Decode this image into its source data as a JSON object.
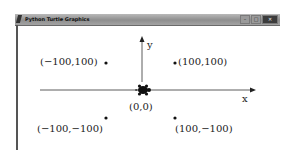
{
  "window": {
    "title": "Python Turtle Graphics",
    "buttons": {
      "minimize": "–",
      "maximize": "□",
      "close": "✕"
    }
  },
  "canvas": {
    "axes": {
      "x_label": "x",
      "y_label": "y"
    },
    "origin_label": "(0,0)",
    "points": [
      {
        "label": "(−100,100)",
        "x": -100,
        "y": 100
      },
      {
        "label": "(100,100)",
        "x": 100,
        "y": 100
      },
      {
        "label": "(−100,−100)",
        "x": -100,
        "y": -100
      },
      {
        "label": "(100,−100)",
        "x": 100,
        "y": -100
      }
    ],
    "colors": {
      "ink": "#222222",
      "background": "#ffffff"
    }
  }
}
